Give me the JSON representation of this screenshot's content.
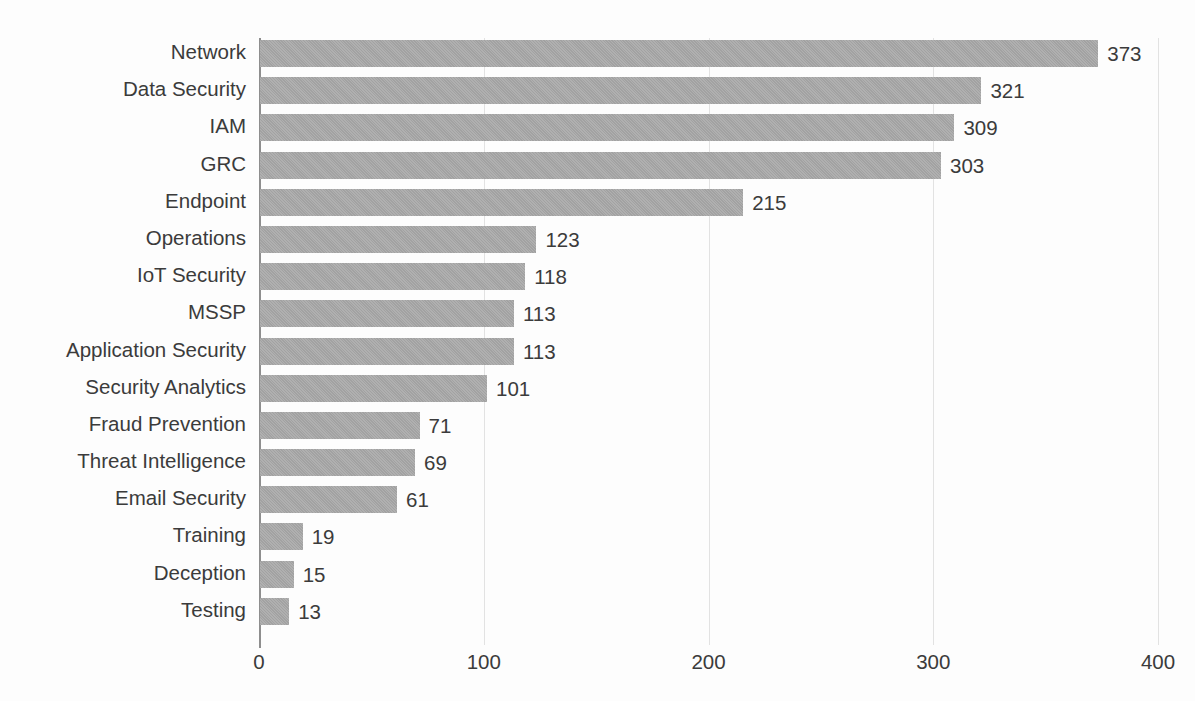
{
  "chart_data": {
    "type": "bar",
    "orientation": "horizontal",
    "title": "",
    "subtitle": "",
    "xlabel": "",
    "ylabel": "",
    "xlim": [
      0,
      400
    ],
    "xticks": [
      "0",
      "100",
      "200",
      "300",
      "400"
    ],
    "grid": true,
    "legend": false,
    "value_labels": true,
    "bar_color": "#a9a9a9",
    "text_color": "#3b3b3b",
    "gridline_color": "#e2e2e2",
    "axis_color": "#8e8e8e",
    "categories": [
      "Network",
      "Data Security",
      "IAM",
      "GRC",
      "Endpoint",
      "Operations",
      "IoT Security",
      "MSSP",
      "Application Security",
      "Security Analytics",
      "Fraud Prevention",
      "Threat Intelligence",
      "Email Security",
      "Training",
      "Deception",
      "Testing"
    ],
    "values": [
      373,
      321,
      309,
      303,
      215,
      123,
      118,
      113,
      113,
      101,
      71,
      69,
      61,
      19,
      15,
      13
    ],
    "labels": [
      "373",
      "321",
      "309",
      "303",
      "215",
      "123",
      "118",
      "113",
      "113",
      "101",
      "71",
      "69",
      "61",
      "19",
      "15",
      "13"
    ]
  }
}
